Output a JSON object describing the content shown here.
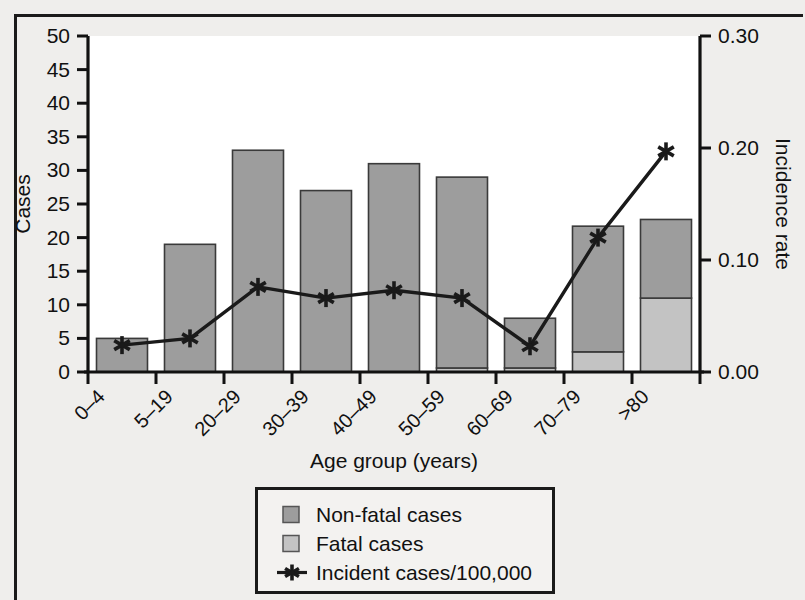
{
  "chart_data": {
    "type": "bar",
    "title": "",
    "xlabel": "Age group (years)",
    "ylabel": "Cases",
    "y2label": "Incidence rate",
    "categories": [
      "0–4",
      "5–19",
      "20–29",
      "30–39",
      "40–49",
      "50–59",
      "60–69",
      "70–79",
      ">80"
    ],
    "ylim": [
      0,
      50
    ],
    "yticks": [
      0,
      5,
      10,
      15,
      20,
      25,
      30,
      35,
      40,
      45,
      50
    ],
    "ytick_labels": [
      "0",
      "5",
      "10",
      "15",
      "20",
      "25",
      "30",
      "35",
      "40",
      "45",
      "50"
    ],
    "y2lim": [
      0.0,
      0.3
    ],
    "y2ticks": [
      0.0,
      0.1,
      0.2,
      0.3
    ],
    "y2tick_labels": [
      "0.00",
      "0.10",
      "0.20",
      "0.30"
    ],
    "grid": false,
    "legend_position": "below-center",
    "series": [
      {
        "name": "Fatal cases",
        "type": "bar",
        "stack": "cases",
        "axis": "left",
        "color": "#c3c3c3",
        "values": [
          0,
          0,
          0,
          0,
          0,
          0.6,
          0.6,
          3,
          11
        ]
      },
      {
        "name": "Non-fatal cases",
        "type": "bar",
        "stack": "cases",
        "axis": "left",
        "color": "#9d9d9d",
        "values": [
          5,
          19,
          33,
          27,
          31,
          28.4,
          7.4,
          18.7,
          11.7
        ]
      },
      {
        "name": "Incident cases/100,000",
        "type": "line",
        "axis": "right",
        "color": "#1a1a1a",
        "marker": "star",
        "values": [
          0.024,
          0.03,
          0.076,
          0.066,
          0.073,
          0.066,
          0.023,
          0.12,
          0.197
        ]
      }
    ],
    "bar_totals": [
      5,
      19,
      33,
      27,
      31,
      29,
      8,
      21.7,
      22.7
    ]
  },
  "legend": {
    "items": [
      {
        "label": "Non-fatal cases",
        "swatch": "non-fatal-swatch",
        "color": "#9d9d9d"
      },
      {
        "label": "Fatal cases",
        "swatch": "fatal-swatch",
        "color": "#c3c3c3"
      },
      {
        "label": "Incident cases/100,000",
        "swatch": "line-star-swatch",
        "color": "#1a1a1a"
      }
    ]
  },
  "axes": {
    "left_title": "Cases",
    "right_title": "Incidence rate",
    "bottom_title": "Age group (years)"
  }
}
